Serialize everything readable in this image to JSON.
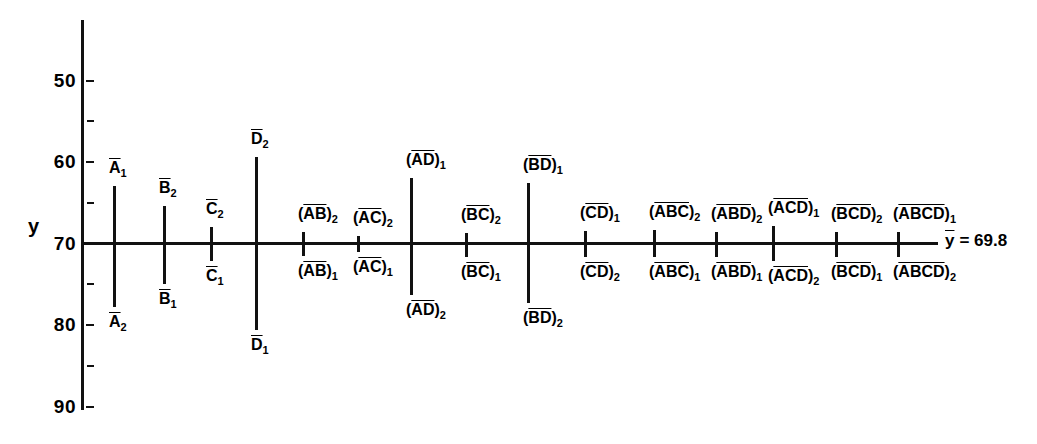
{
  "chart_data": {
    "type": "bar",
    "title": "",
    "xlabel": "",
    "ylabel": "y",
    "ylim": [
      50,
      95
    ],
    "yticks_major": [
      50,
      60,
      70,
      80,
      90
    ],
    "yticks_minor": [
      55,
      65,
      75,
      85
    ],
    "grand_mean": 69.8,
    "grand_mean_label": "= 69.8",
    "grand_mean_symbol": "y",
    "reference_line_value": 70,
    "grid": false,
    "legend": null,
    "note": "Factorial effects plot: each vertical bar spans the two level means of an effect.",
    "categories": [
      "A",
      "B",
      "C",
      "D",
      "(AB)",
      "(AC)",
      "(AD)",
      "(BC)",
      "(BD)",
      "(CD)",
      "(ABC)",
      "(ABD)",
      "(ACD)",
      "(BCD)",
      "(ABCD)"
    ],
    "effects": [
      {
        "name": "A",
        "x": 113,
        "top_label": "A",
        "top_sub": "1",
        "bottom_label": "A",
        "bottom_sub": "2",
        "top_value": 77.1,
        "bottom_value": 62.2
      },
      {
        "name": "B",
        "x": 163,
        "top_label": "B",
        "top_sub": "2",
        "bottom_label": "B",
        "bottom_sub": "1",
        "top_value": 74.6,
        "bottom_value": 65.0
      },
      {
        "name": "C",
        "x": 210,
        "top_label": "C",
        "top_sub": "2",
        "bottom_label": "C",
        "bottom_sub": "1",
        "top_value": 72.0,
        "bottom_value": 67.9
      },
      {
        "name": "D",
        "x": 255,
        "top_label": "D",
        "top_sub": "2",
        "bottom_label": "D",
        "bottom_sub": "1",
        "top_value": 80.6,
        "bottom_value": 59.4
      },
      {
        "name": "(AB)",
        "x": 302,
        "top_label": "(AB)",
        "top_sub": "2",
        "bottom_label": "(AB)",
        "bottom_sub": "1",
        "top_value": 71.4,
        "bottom_value": 68.5
      },
      {
        "name": "(AC)",
        "x": 357,
        "top_label": "(AC)",
        "top_sub": "2",
        "bottom_label": "(AC)",
        "bottom_sub": "1",
        "top_value": 70.9,
        "bottom_value": 69.0
      },
      {
        "name": "(AD)",
        "x": 410,
        "top_label": "(AD)",
        "top_sub": "1",
        "bottom_label": "(AD)",
        "bottom_sub": "2",
        "top_value": 78.0,
        "bottom_value": 63.7
      },
      {
        "name": "(BC)",
        "x": 465,
        "top_label": "(BC)",
        "top_sub": "2",
        "bottom_label": "(BC)",
        "bottom_sub": "1",
        "top_value": 71.3,
        "bottom_value": 68.3
      },
      {
        "name": "(BD)",
        "x": 527,
        "top_label": "(BD)",
        "top_sub": "1",
        "bottom_label": "(BD)",
        "bottom_sub": "2",
        "top_value": 77.4,
        "bottom_value": 62.7
      },
      {
        "name": "(CD)",
        "x": 584,
        "top_label": "(CD)",
        "top_sub": "1",
        "bottom_label": "(CD)",
        "bottom_sub": "2",
        "top_value": 71.5,
        "bottom_value": 68.4
      },
      {
        "name": "(ABC)",
        "x": 653,
        "top_label": "(ABC)",
        "top_sub": "2",
        "bottom_label": "(ABC)",
        "bottom_sub": "1",
        "top_value": 71.6,
        "bottom_value": 68.3
      },
      {
        "name": "(ABD)",
        "x": 715,
        "top_label": "(ABD)",
        "top_sub": "2",
        "bottom_label": "(ABD)",
        "bottom_sub": "1",
        "top_value": 71.4,
        "bottom_value": 68.4
      },
      {
        "name": "(ACD)",
        "x": 772,
        "top_label": "(ACD)",
        "top_sub": "1",
        "bottom_label": "(ACD)",
        "bottom_sub": "2",
        "top_value": 72.2,
        "bottom_value": 67.8
      },
      {
        "name": "(BCD)",
        "x": 835,
        "top_label": "(BCD)",
        "top_sub": "2",
        "bottom_label": "(BCD)",
        "bottom_sub": "1",
        "top_value": 71.4,
        "bottom_value": 68.4
      },
      {
        "name": "(ABCD)",
        "x": 897,
        "top_label": "(ABCD)",
        "top_sub": "1",
        "bottom_label": "(ABCD)",
        "bottom_sub": "2",
        "top_value": 71.4,
        "bottom_value": 68.4
      }
    ]
  },
  "axis": {
    "y_label": "y",
    "tick_labels": [
      "90",
      "80",
      "70",
      "60",
      "50"
    ]
  },
  "annotations": {
    "mean_symbol": "y",
    "mean_text": "= 69.8"
  }
}
